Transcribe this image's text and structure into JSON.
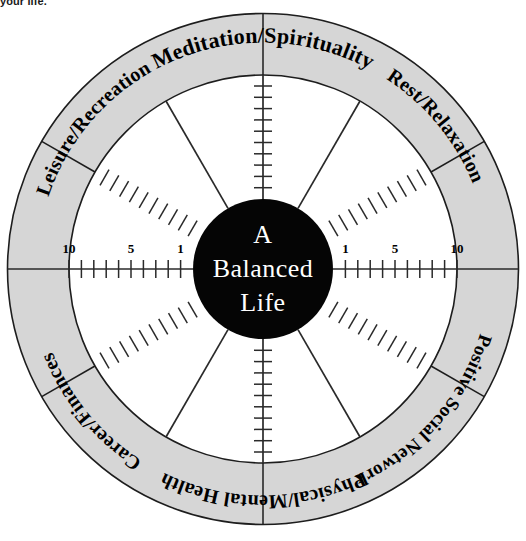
{
  "caption": {
    "text": "your life."
  },
  "diagram": {
    "title": "A Balanced Life",
    "hub_lines": [
      "A",
      "Balanced",
      "Life"
    ],
    "type": "balance-wheel",
    "sectors": [
      {
        "id": "meditation-spirituality",
        "label": "Meditation/Spirituality",
        "angle_deg": -90
      },
      {
        "id": "rest-relaxation",
        "label": "Rest/Relaxation",
        "angle_deg": -30
      },
      {
        "id": "positive-social-network",
        "label": "Positive Social Network",
        "angle_deg": 30
      },
      {
        "id": "physical-mental-health",
        "label": "Physical/Mental Health",
        "angle_deg": 90
      },
      {
        "id": "career-finances",
        "label": "Career/Finances",
        "angle_deg": 150
      },
      {
        "id": "leisure-recreation",
        "label": "Leisure/Recreation",
        "angle_deg": 210
      }
    ],
    "scale": {
      "ticks_per_spoke": 10,
      "labeled_values": [
        "10",
        "5",
        "1"
      ],
      "outer_value": "10",
      "mid_value": "5",
      "inner_value": "1"
    },
    "spokes_deg": [
      0,
      60,
      90,
      120,
      180,
      240,
      270,
      300
    ],
    "geometry": {
      "cx": 263,
      "cy": 269,
      "r_outer": 256,
      "r_ring_inner": 194,
      "r_hub": 70
    },
    "colors": {
      "ring_fill": "#d6d6d6",
      "hub_fill": "#050505",
      "stroke": "#1d1d1d",
      "background": "#ffffff",
      "hub_text": "#ffffff"
    }
  }
}
